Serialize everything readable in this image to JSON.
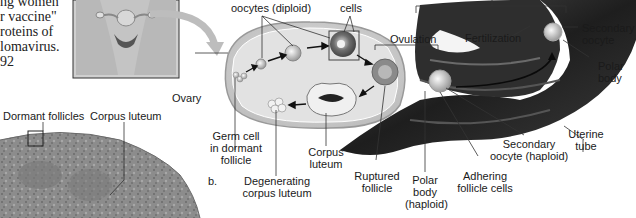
{
  "body_text": {
    "lines": [
      "ng women",
      "r vaccine\"",
      "roteins  of",
      "lomavirus.",
      "92"
    ]
  },
  "figure": {
    "panel_b_label": "b.",
    "labels": {
      "oocytes_diploid": "oocytes (diploid)",
      "cells": "cells",
      "ovulation": "Ovulation",
      "fertilization": "Fertilization",
      "secondary_oocyte_top": [
        "Secondary",
        "oocyte"
      ],
      "polar_body_right": [
        "Polar",
        "body"
      ],
      "ovary": "Ovary",
      "germ_cell": [
        "Germ cell",
        "in dormant",
        "follicle"
      ],
      "corpus_luteum": [
        "Corpus",
        "luteum"
      ],
      "degenerating_corpus_luteum": [
        "Degenerating",
        "corpus luteum"
      ],
      "ruptured_follicle": [
        "Ruptured",
        "follicle"
      ],
      "polar_body_haploid": [
        "Polar",
        "body",
        "(haploid)"
      ],
      "adhering_follicle_cells": [
        "Adhering",
        "follicle cells"
      ],
      "secondary_oocyte_haploid": [
        "Secondary",
        "oocyte (haploid)"
      ],
      "uterine_tube": [
        "Uterine",
        "tube"
      ]
    },
    "micrograph_labels": {
      "dormant_follicles": "Dormant follicles",
      "corpus_luteum": "Corpus luteum"
    },
    "colors": {
      "ovary_fill": "#d9d9d9",
      "tube_dark": "#2a2a2a",
      "micrograph": "#8a8a8a",
      "leader_line": "#333333"
    }
  }
}
